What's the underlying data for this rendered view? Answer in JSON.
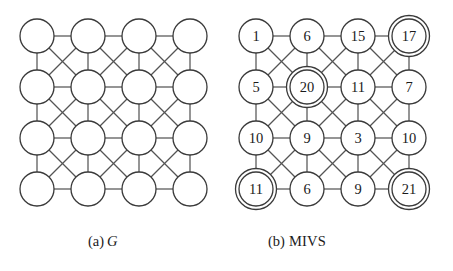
{
  "figure": {
    "type": "graph-diagram",
    "background": "#ffffff",
    "edge_color": "#555555",
    "node_fill": "#ffffff",
    "node_stroke": "#3a3a3a",
    "text_color": "#1a1a1a",
    "grid": {
      "rows": 4,
      "cols": 4,
      "connectivity": "king-graph-8-neighbor"
    }
  },
  "panels": [
    {
      "id": "panel-a",
      "caption_prefix": "(a)",
      "caption_label": "G",
      "caption_italic": true,
      "shows_labels": false,
      "nodes": [
        {
          "row": 0,
          "col": 0,
          "label": "",
          "selected": false
        },
        {
          "row": 0,
          "col": 1,
          "label": "",
          "selected": false
        },
        {
          "row": 0,
          "col": 2,
          "label": "",
          "selected": false
        },
        {
          "row": 0,
          "col": 3,
          "label": "",
          "selected": false
        },
        {
          "row": 1,
          "col": 0,
          "label": "",
          "selected": false
        },
        {
          "row": 1,
          "col": 1,
          "label": "",
          "selected": false
        },
        {
          "row": 1,
          "col": 2,
          "label": "",
          "selected": false
        },
        {
          "row": 1,
          "col": 3,
          "label": "",
          "selected": false
        },
        {
          "row": 2,
          "col": 0,
          "label": "",
          "selected": false
        },
        {
          "row": 2,
          "col": 1,
          "label": "",
          "selected": false
        },
        {
          "row": 2,
          "col": 2,
          "label": "",
          "selected": false
        },
        {
          "row": 2,
          "col": 3,
          "label": "",
          "selected": false
        },
        {
          "row": 3,
          "col": 0,
          "label": "",
          "selected": false
        },
        {
          "row": 3,
          "col": 1,
          "label": "",
          "selected": false
        },
        {
          "row": 3,
          "col": 2,
          "label": "",
          "selected": false
        },
        {
          "row": 3,
          "col": 3,
          "label": "",
          "selected": false
        }
      ]
    },
    {
      "id": "panel-b",
      "caption_prefix": "(b)",
      "caption_label": "MIVS",
      "caption_italic": false,
      "shows_labels": true,
      "nodes": [
        {
          "row": 0,
          "col": 0,
          "label": "1",
          "selected": false
        },
        {
          "row": 0,
          "col": 1,
          "label": "6",
          "selected": false
        },
        {
          "row": 0,
          "col": 2,
          "label": "15",
          "selected": false
        },
        {
          "row": 0,
          "col": 3,
          "label": "17",
          "selected": true
        },
        {
          "row": 1,
          "col": 0,
          "label": "5",
          "selected": false
        },
        {
          "row": 1,
          "col": 1,
          "label": "20",
          "selected": true
        },
        {
          "row": 1,
          "col": 2,
          "label": "11",
          "selected": false
        },
        {
          "row": 1,
          "col": 3,
          "label": "7",
          "selected": false
        },
        {
          "row": 2,
          "col": 0,
          "label": "10",
          "selected": false
        },
        {
          "row": 2,
          "col": 1,
          "label": "9",
          "selected": false
        },
        {
          "row": 2,
          "col": 2,
          "label": "3",
          "selected": false
        },
        {
          "row": 2,
          "col": 3,
          "label": "10",
          "selected": false
        },
        {
          "row": 3,
          "col": 0,
          "label": "11",
          "selected": true
        },
        {
          "row": 3,
          "col": 1,
          "label": "6",
          "selected": false
        },
        {
          "row": 3,
          "col": 2,
          "label": "9",
          "selected": false
        },
        {
          "row": 3,
          "col": 3,
          "label": "21",
          "selected": true
        }
      ]
    }
  ]
}
